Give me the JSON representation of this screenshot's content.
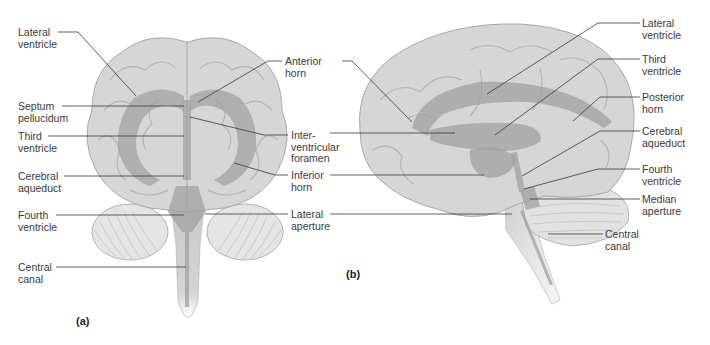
{
  "figure": {
    "panel_a": {
      "caption": "(a)",
      "view": "anterior",
      "labels": {
        "lateral_ventricle": "Lateral\nventricle",
        "septum_pellucidum": "Septum\npellucidum",
        "third_ventricle": "Third\nventricle",
        "cerebral_aqueduct": "Cerebral\naqueduct",
        "fourth_ventricle": "Fourth\nventricle",
        "central_canal": "Central\ncanal",
        "anterior_horn": "Anterior\nhorn",
        "interventricular_foramen": "Inter-\nventricular\nforamen",
        "inferior_horn": "Inferior\nhorn",
        "lateral_aperture": "Lateral\naperture"
      }
    },
    "panel_b": {
      "caption": "(b)",
      "view": "lateral",
      "labels": {
        "lateral_ventricle": "Lateral\nventricle",
        "third_ventricle": "Third\nventricle",
        "posterior_horn": "Posterior\nhorn",
        "cerebral_aqueduct": "Cerebral\naqueduct",
        "fourth_ventricle": "Fourth\nventricle",
        "median_aperture": "Median\naperture",
        "central_canal": "Central\ncanal"
      }
    },
    "colors": {
      "brain_fill": "#d8d8d8",
      "brain_stroke": "#a8a8a8",
      "ventricle": "#9e9e9e",
      "leader_line": "#3a3a3a",
      "label_text": "#3a3a3a"
    }
  }
}
